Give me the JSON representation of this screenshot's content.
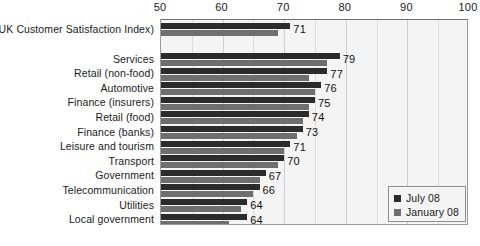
{
  "chart_data": {
    "type": "bar",
    "orientation": "horizontal",
    "title": "",
    "xlabel": "",
    "ylabel": "",
    "xlim": [
      50,
      100
    ],
    "xticks": [
      50,
      60,
      70,
      80,
      90,
      100
    ],
    "xtick_labels": [
      "50",
      "60",
      "70",
      "80",
      "90",
      "100"
    ],
    "minor_tick_step": 5,
    "grid": true,
    "legend_position": "bottom-right",
    "categories": [
      "UKCSI (UK Customer Satisfaction Index)",
      "Services",
      "Retail (non-food)",
      "Automotive",
      "Finance (insurers)",
      "Retail (food)",
      "Finance (banks)",
      "Leisure and tourism",
      "Transport",
      "Government",
      "Telecommunication",
      "Utilities",
      "Local government"
    ],
    "series": [
      {
        "name": "July 08",
        "color": "#2b2b2b",
        "values": [
          71,
          79,
          77,
          76,
          75,
          74,
          73,
          71,
          70,
          67,
          66,
          64,
          64
        ]
      },
      {
        "name": "January 08",
        "color": "#6e6e6e",
        "values": [
          69,
          77,
          74,
          75,
          74,
          73,
          72,
          70,
          69,
          66,
          65,
          63,
          61
        ]
      }
    ],
    "data_labels": [
      "71",
      "79",
      "77",
      "76",
      "75",
      "74",
      "73",
      "71",
      "70",
      "67",
      "66",
      "64",
      "64"
    ],
    "data_label_series": "July 08"
  },
  "legend": {
    "entries": [
      {
        "label": "July 08",
        "color": "#2b2b2b"
      },
      {
        "label": "January 08",
        "color": "#6e6e6e"
      }
    ]
  },
  "colors": {
    "july": "#2b2b2b",
    "january": "#6e6e6e",
    "plot_background": "#f4f4f4",
    "gridline": "#dcdcdc",
    "text": "#1a1a1a"
  }
}
